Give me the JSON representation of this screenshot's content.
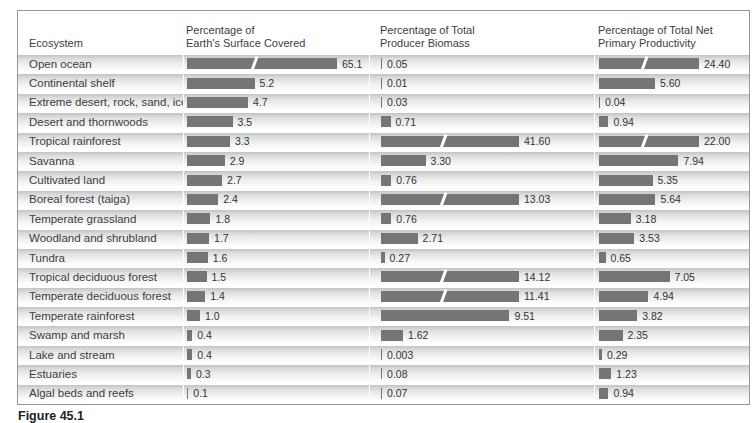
{
  "page": {
    "caption": "Figure 45.1"
  },
  "table": {
    "headers": {
      "ecosystem": "Ecosystem",
      "surface": [
        "Percentage of",
        "Earth's Surface Covered"
      ],
      "biomass": [
        "Percentage of Total",
        "Producer Biomass"
      ],
      "productivity": [
        "Percentage of Total Net",
        "Primary Productivity"
      ]
    },
    "rows": [
      {
        "ecosystem": "Open ocean",
        "surface": "65.1",
        "biomass": "0.05",
        "productivity": "24.40"
      },
      {
        "ecosystem": "Continental shelf",
        "surface": "5.2",
        "biomass": "0.01",
        "productivity": "5.60"
      },
      {
        "ecosystem": "Extreme desert, rock, sand, ice",
        "surface": "4.7",
        "biomass": "0.03",
        "productivity": "0.04"
      },
      {
        "ecosystem": "Desert and thornwoods",
        "surface": "3.5",
        "biomass": "0.71",
        "productivity": "0.94"
      },
      {
        "ecosystem": "Tropical rainforest",
        "surface": "3.3",
        "biomass": "41.60",
        "productivity": "22.00"
      },
      {
        "ecosystem": "Savanna",
        "surface": "2.9",
        "biomass": "3.30",
        "productivity": "7.94"
      },
      {
        "ecosystem": "Cultivated land",
        "surface": "2.7",
        "biomass": "0.76",
        "productivity": "5.35"
      },
      {
        "ecosystem": "Boreal forest (taiga)",
        "surface": "2.4",
        "biomass": "13.03",
        "productivity": "5.64"
      },
      {
        "ecosystem": "Temperate grassland",
        "surface": "1.8",
        "biomass": "0.76",
        "productivity": "3.18"
      },
      {
        "ecosystem": "Woodland and shrubland",
        "surface": "1.7",
        "biomass": "2.71",
        "productivity": "3.53"
      },
      {
        "ecosystem": "Tundra",
        "surface": "1.6",
        "biomass": "0.27",
        "productivity": "0.65"
      },
      {
        "ecosystem": "Tropical deciduous forest",
        "surface": "1.5",
        "biomass": "14.12",
        "productivity": "7.05"
      },
      {
        "ecosystem": "Temperate deciduous forest",
        "surface": "1.4",
        "biomass": "11.41",
        "productivity": "4.94"
      },
      {
        "ecosystem": "Temperate rainforest",
        "surface": "1.0",
        "biomass": "9.51",
        "productivity": "3.82"
      },
      {
        "ecosystem": "Swamp and marsh",
        "surface": "0.4",
        "biomass": "1.62",
        "productivity": "2.35"
      },
      {
        "ecosystem": "Lake and stream",
        "surface": "0.4",
        "biomass": "0.003",
        "productivity": "0.29"
      },
      {
        "ecosystem": "Estuaries",
        "surface": "0.3",
        "biomass": "0.08",
        "productivity": "1.23"
      },
      {
        "ecosystem": "Algal beds and reefs",
        "surface": "0.1",
        "biomass": "0.07",
        "productivity": "0.94"
      }
    ]
  },
  "chart_data": {
    "type": "bar",
    "orientation": "horizontal",
    "title": "",
    "categories": [
      "Open ocean",
      "Continental shelf",
      "Extreme desert, rock, sand, ice",
      "Desert and thornwoods",
      "Tropical rainforest",
      "Savanna",
      "Cultivated land",
      "Boreal forest (taiga)",
      "Temperate grassland",
      "Woodland and shrubland",
      "Tundra",
      "Tropical deciduous forest",
      "Temperate deciduous forest",
      "Temperate rainforest",
      "Swamp and marsh",
      "Lake and stream",
      "Estuaries",
      "Algal beds and reefs"
    ],
    "series": [
      {
        "name": "Percentage of Earth's Surface Covered",
        "values": [
          65.1,
          5.2,
          4.7,
          3.5,
          3.3,
          2.9,
          2.7,
          2.4,
          1.8,
          1.7,
          1.6,
          1.5,
          1.4,
          1.0,
          0.4,
          0.4,
          0.3,
          0.1
        ]
      },
      {
        "name": "Percentage of Total Producer Biomass",
        "values": [
          0.05,
          0.01,
          0.03,
          0.71,
          41.6,
          3.3,
          0.76,
          13.03,
          0.76,
          2.71,
          0.27,
          14.12,
          11.41,
          9.51,
          1.62,
          0.003,
          0.08,
          0.07
        ]
      },
      {
        "name": "Percentage of Total Net Primary Productivity",
        "values": [
          24.4,
          5.6,
          0.04,
          0.94,
          22.0,
          7.94,
          5.35,
          5.64,
          3.18,
          3.53,
          0.65,
          7.05,
          4.94,
          3.82,
          2.35,
          0.29,
          1.23,
          0.94
        ]
      }
    ],
    "render": {
      "series_px": [
        {
          "px_per_unit": 13,
          "max_px": 150
        },
        {
          "px_per_unit": 13.5,
          "max_px": 138
        },
        {
          "px_per_unit": 10,
          "max_px": 100
        }
      ]
    }
  },
  "colors": {
    "bar": "#757575",
    "row_gradient_top": "#c3c3c3",
    "text": "#3d3d3d",
    "table_border": "#979797"
  }
}
